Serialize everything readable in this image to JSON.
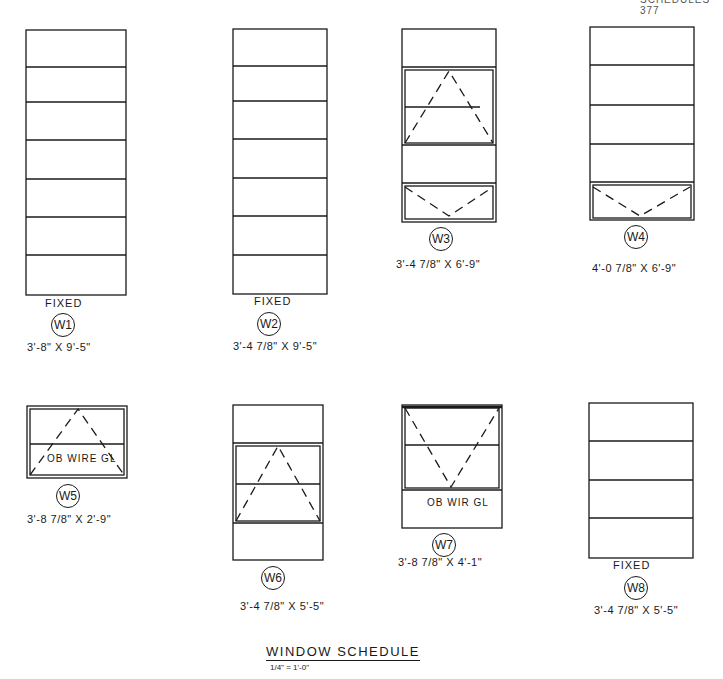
{
  "header": {
    "page_header": "SCHEDULES 377"
  },
  "title": {
    "text": "WINDOW SCHEDULE",
    "scale": "1/4\" = 1'-0\""
  },
  "windows": [
    {
      "tag": "W1",
      "type": "FIXED",
      "size": "3'-8\" X 9'-5\""
    },
    {
      "tag": "W2",
      "type": "FIXED",
      "size": "3'-4 7/8\" X 9'-5\""
    },
    {
      "tag": "W3",
      "type": "",
      "size": "3'-4 7/8\" X 6'-9\""
    },
    {
      "tag": "W4",
      "type": "",
      "size": "4'-0 7/8\" X 6'-9\""
    },
    {
      "tag": "W5",
      "type": "",
      "size": "3'-8 7/8\" X 2'-9\"",
      "note": "OB WIRE GL"
    },
    {
      "tag": "W6",
      "type": "",
      "size": "3'-4 7/8\" X 5'-5\""
    },
    {
      "tag": "W7",
      "type": "",
      "size": "3'-8 7/8\" X 4'-1\"",
      "note": "OB WIR GL"
    },
    {
      "tag": "W8",
      "type": "FIXED",
      "size": "3'-4 7/8\" X 5'-5\""
    }
  ],
  "colors": {
    "line": "#1a1a1a",
    "background": "#ffffff"
  }
}
